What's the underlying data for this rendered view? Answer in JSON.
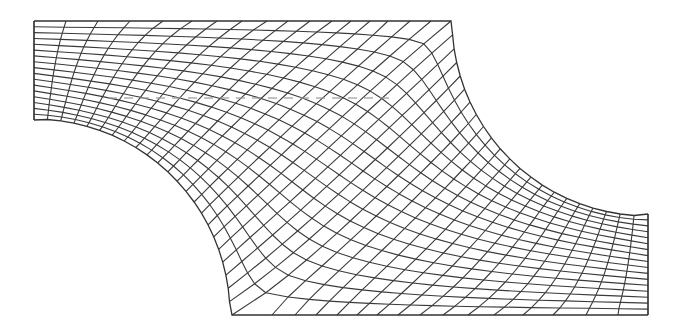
{
  "figure": {
    "title": "Structured quadrilateral mesh of a 2D channel with two opposing circular fillets",
    "width": 676,
    "height": 330,
    "line_color": "#3a3a3a",
    "background": "#ffffff"
  },
  "mesh": {
    "columns": 39,
    "rows": 17,
    "left_edge": {
      "x": 34,
      "y_top": 21,
      "y_bottom": 120
    },
    "right_edge": {
      "x": 648,
      "y_top": 214,
      "y_bottom": 315
    },
    "top_edge_x": [
      34,
      66,
      98,
      130,
      163,
      192,
      217,
      242,
      267,
      288,
      310,
      332,
      351,
      370,
      388,
      410,
      431,
      451
    ],
    "top_edge_y": 21,
    "bottom_edge_x": [
      232,
      272,
      295,
      316,
      337,
      357,
      377,
      398,
      420,
      443,
      468,
      494,
      523,
      553,
      586,
      618,
      648
    ],
    "bottom_edge_y": 315,
    "lower_left_arc": {
      "cx": 34,
      "cy": 315,
      "r": 196,
      "from": {
        "x": 34,
        "y": 120
      },
      "to": {
        "x": 232,
        "y": 315
      }
    },
    "upper_right_arc": {
      "cx": 648,
      "cy": 20,
      "r": 196,
      "from": {
        "x": 451,
        "y": 21
      },
      "to": {
        "x": 648,
        "y": 214
      }
    },
    "corner_diagonals": [
      {
        "label": "top-right corner",
        "x": 451,
        "y": 21
      },
      {
        "label": "bottom-left corner",
        "x": 232,
        "y": 315
      }
    ]
  },
  "annotation": {
    "dashed_line": {
      "x1": 108,
      "y1": 98,
      "x2": 392,
      "y2": 98,
      "color": "#9a9a9a"
    }
  }
}
